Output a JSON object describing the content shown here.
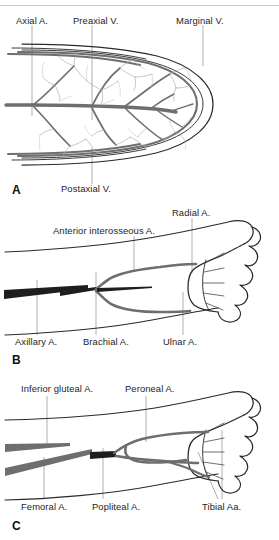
{
  "figure": {
    "background_color": "#ffffff",
    "vessel_color_artery_dark": "#1e1e20",
    "vessel_color_artery_mid": "#6e6e72",
    "vessel_color_plexus": "#a9a9ae",
    "outline_color": "#2a2a2a",
    "leader_color": "#8d8d92"
  },
  "panels": [
    {
      "letter": "A",
      "name": "embryonic-limb-bud",
      "labels_top": [
        {
          "text": "Axial A.",
          "x": 16,
          "y": 20
        },
        {
          "text": "Preaxial V.",
          "x": 73,
          "y": 20
        },
        {
          "text": "Marginal V.",
          "x": 176,
          "y": 20
        }
      ],
      "labels_bottom": [
        {
          "text": "Postaxial V.",
          "x": 61,
          "y": 188
        }
      ]
    },
    {
      "letter": "B",
      "name": "upper-limb-arteries",
      "labels_top": [
        {
          "text": "Radial A.",
          "x": 172,
          "y": 213
        },
        {
          "text": "Anterior interosseous A.",
          "x": 53,
          "y": 230
        }
      ],
      "labels_bottom": [
        {
          "text": "Axillary A.",
          "x": 15,
          "y": 341
        },
        {
          "text": "Brachial A.",
          "x": 83,
          "y": 341
        },
        {
          "text": "Ulnar A.",
          "x": 163,
          "y": 341
        }
      ]
    },
    {
      "letter": "C",
      "name": "lower-limb-arteries",
      "labels_top": [
        {
          "text": "Inferior gluteal A.",
          "x": 21,
          "y": 392
        },
        {
          "text": "Peroneal A.",
          "x": 125,
          "y": 392
        }
      ],
      "labels_bottom": [
        {
          "text": "Femoral A.",
          "x": 21,
          "y": 507
        },
        {
          "text": "Popliteal A.",
          "x": 92,
          "y": 507
        },
        {
          "text": "Tibial Aa.",
          "x": 202,
          "y": 507
        }
      ]
    }
  ],
  "panel_letters": [
    {
      "text": "A",
      "x": 14,
      "y": 190
    },
    {
      "text": "B",
      "x": 14,
      "y": 362
    },
    {
      "text": "C",
      "x": 14,
      "y": 529
    }
  ]
}
